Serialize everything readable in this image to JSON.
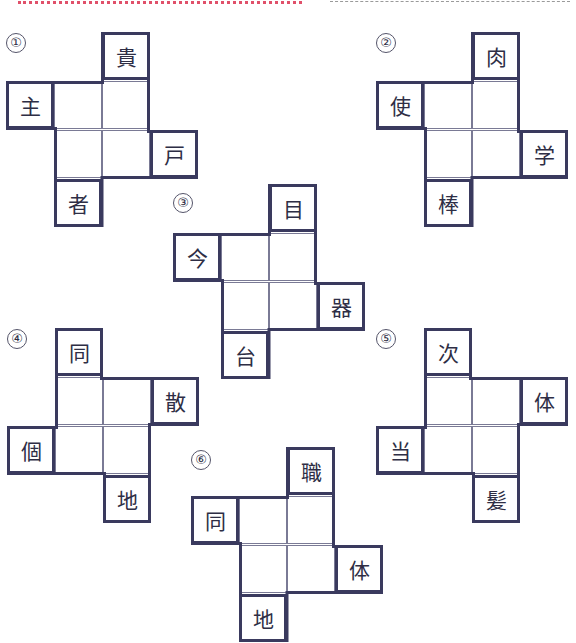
{
  "page": {
    "decorations": [
      "red-dotted-rule",
      "gray-dashed-rule"
    ]
  },
  "colors": {
    "border": "#3a3a5e",
    "grid_line": "#7a7a95",
    "text": "#2e2e45",
    "top_rule_red": "#e0506a",
    "top_rule_gray": "#9a9a9a"
  },
  "puzzles": [
    {
      "number": "①",
      "shape": "A",
      "top": "貴",
      "left": "主",
      "right": "戸",
      "bottom": "者",
      "blanks": 4
    },
    {
      "number": "②",
      "shape": "A",
      "top": "肉",
      "left": "使",
      "right": "学",
      "bottom": "棒",
      "blanks": 4
    },
    {
      "number": "③",
      "shape": "A",
      "top": "目",
      "left": "今",
      "right": "器",
      "bottom": "台",
      "blanks": 4
    },
    {
      "number": "④",
      "shape": "B",
      "top": "同",
      "left": "個",
      "right": "散",
      "bottom": "地",
      "blanks": 4
    },
    {
      "number": "⑤",
      "shape": "B",
      "top": "次",
      "left": "当",
      "right": "体",
      "bottom": "髪",
      "blanks": 4
    },
    {
      "number": "⑥",
      "shape": "A",
      "top": "職",
      "left": "同",
      "right": "体",
      "bottom": "地",
      "blanks": 4
    }
  ]
}
